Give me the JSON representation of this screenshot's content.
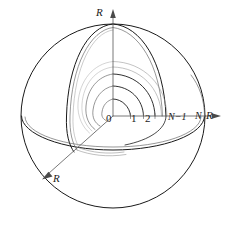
{
  "figure": {
    "type": "technical-diagram",
    "background_color": "#ffffff",
    "line_color": "#1a1a1a",
    "shell_line_color": "#555555",
    "faint_line_color": "#999999"
  },
  "axes": [
    {
      "id": "vertical",
      "label": "R",
      "direction": "up",
      "arrow": true
    },
    {
      "id": "horizontal",
      "label": "R",
      "direction": "right",
      "arrow": true
    },
    {
      "id": "depth",
      "label": "R",
      "direction": "down-left",
      "arrow": true
    }
  ],
  "shell_labels": [
    {
      "index": 0,
      "text": "0"
    },
    {
      "index": 1,
      "text": "1"
    },
    {
      "index": 2,
      "text": "2"
    },
    {
      "index": 3,
      "text": "N−1"
    },
    {
      "index": 4,
      "text": "N"
    }
  ],
  "axis_labels": {
    "vertical": "R",
    "horizontal": "R",
    "depth": "R"
  }
}
